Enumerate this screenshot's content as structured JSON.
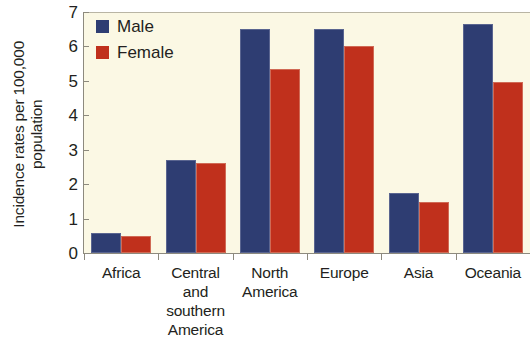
{
  "chart_data": {
    "type": "bar",
    "title": "",
    "xlabel": "",
    "ylabel_line1": "Incidence rates per 100,000",
    "ylabel_line2": "population",
    "categories": [
      "Africa",
      "Central and southern America",
      "North America",
      "Europe",
      "Asia",
      "Oceania"
    ],
    "category_label_lines": [
      [
        "Africa"
      ],
      [
        "Central",
        "and",
        "southern",
        "America"
      ],
      [
        "North",
        "America"
      ],
      [
        "Europe"
      ],
      [
        "Asia"
      ],
      [
        "Oceania"
      ]
    ],
    "series": [
      {
        "name": "Male",
        "color": "#2e3d72",
        "values": [
          0.58,
          2.7,
          6.52,
          6.52,
          1.73,
          6.65
        ]
      },
      {
        "name": "Female",
        "color": "#c0301c",
        "values": [
          0.5,
          2.62,
          5.35,
          6.02,
          1.48,
          4.98
        ]
      }
    ],
    "ylim": [
      0,
      7
    ],
    "yticks": [
      0,
      1,
      2,
      3,
      4,
      5,
      6,
      7
    ],
    "ytick_labels": [
      "0",
      "1",
      "2",
      "3",
      "4",
      "5",
      "6",
      "7"
    ],
    "grid": false,
    "legend_position": "top-left",
    "plot_background": "#fbf8e4"
  },
  "legend": {
    "entries": [
      {
        "label": "Male"
      },
      {
        "label": "Female"
      }
    ]
  }
}
